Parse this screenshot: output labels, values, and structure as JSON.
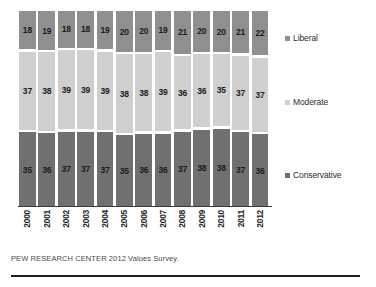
{
  "chart_data": {
    "type": "bar",
    "subtype": "stacked-column-100pct",
    "title": "",
    "xlabel": "",
    "ylabel": "",
    "ylim": [
      0,
      100
    ],
    "grid": false,
    "legend_position": "right",
    "categories": [
      "2000",
      "2001",
      "2002",
      "2003",
      "2004",
      "2005",
      "2006",
      "2007",
      "2008",
      "2009",
      "2010",
      "2011",
      "2012"
    ],
    "series": [
      {
        "name": "Liberal",
        "color": "#8f8f8f",
        "values": [
          18,
          19,
          18,
          18,
          19,
          20,
          20,
          19,
          21,
          20,
          20,
          21,
          22
        ]
      },
      {
        "name": "Moderate",
        "color": "#cfcfcf",
        "values": [
          37,
          38,
          39,
          39,
          39,
          38,
          38,
          39,
          36,
          36,
          35,
          37,
          37
        ]
      },
      {
        "name": "Conservative",
        "color": "#707070",
        "values": [
          35,
          36,
          37,
          37,
          37,
          35,
          36,
          36,
          37,
          38,
          38,
          37,
          36
        ]
      }
    ],
    "stack_order_top_to_bottom": [
      "Liberal",
      "Moderate",
      "Conservative"
    ],
    "source_note": "PEW RESEARCH CENTER 2012 Values Survey."
  },
  "legend": {
    "items": [
      {
        "label": "Liberal",
        "color": "#8f8f8f"
      },
      {
        "label": "Moderate",
        "color": "#cfcfcf"
      },
      {
        "label": "Conservative",
        "color": "#707070"
      }
    ]
  },
  "footer": {
    "source": "PEW RESEARCH CENTER 2012 Values Survey."
  }
}
